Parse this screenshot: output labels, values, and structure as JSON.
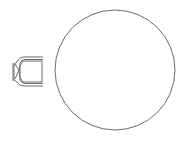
{
  "diagram": {
    "title": "",
    "elements": [
      {
        "id": "round-table",
        "shape": "circle",
        "cx": 115,
        "cy": 70,
        "r": 60
      },
      {
        "id": "chair",
        "shape": "chair-symbol",
        "x": 12,
        "y": 57,
        "w": 32,
        "h": 29
      }
    ],
    "colors": {
      "stroke": "#6b6b6b",
      "background": "#ffffff"
    }
  }
}
